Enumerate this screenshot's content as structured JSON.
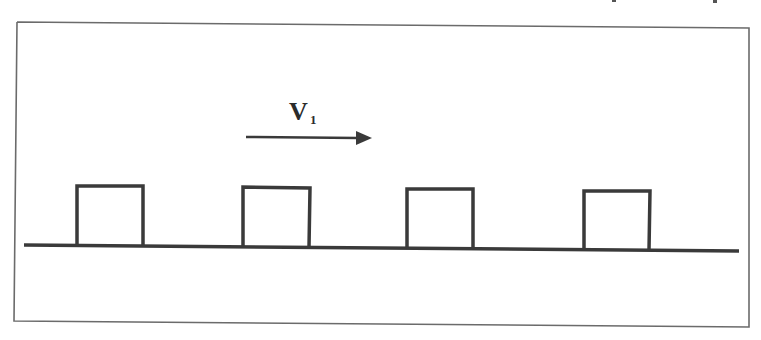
{
  "diagram": {
    "velocity_label": "V",
    "velocity_subscript": "1",
    "arrow_direction": "right",
    "block_count": 4,
    "colors": {
      "stroke": "#3a3a3a",
      "frame": "#6b6b6b",
      "background": "#ffffff"
    }
  }
}
